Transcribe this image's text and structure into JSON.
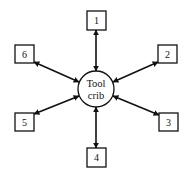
{
  "diagram": {
    "type": "hub-and-spoke",
    "hub": {
      "label_line1": "Tool",
      "label_line2": "crib",
      "cx": 96,
      "cy": 89,
      "r": 18
    },
    "colors": {
      "stroke": "#111111",
      "fill": "#ffffff"
    },
    "nodes": [
      {
        "id": "1",
        "label": "1",
        "x": 87,
        "y": 11,
        "w": 19,
        "h": 19
      },
      {
        "id": "2",
        "label": "2",
        "x": 158,
        "y": 45,
        "w": 19,
        "h": 18
      },
      {
        "id": "3",
        "label": "3",
        "x": 159,
        "y": 113,
        "w": 19,
        "h": 18
      },
      {
        "id": "4",
        "label": "4",
        "x": 87,
        "y": 148,
        "w": 19,
        "h": 19
      },
      {
        "id": "5",
        "label": "5",
        "x": 15,
        "y": 113,
        "w": 19,
        "h": 18
      },
      {
        "id": "6",
        "label": "6",
        "x": 15,
        "y": 45,
        "w": 19,
        "h": 18
      }
    ],
    "edges": [
      {
        "from": "hub",
        "to": "1",
        "bidirectional": true
      },
      {
        "from": "hub",
        "to": "2",
        "bidirectional": true
      },
      {
        "from": "hub",
        "to": "3",
        "bidirectional": true
      },
      {
        "from": "hub",
        "to": "4",
        "bidirectional": true
      },
      {
        "from": "hub",
        "to": "5",
        "bidirectional": true
      },
      {
        "from": "hub",
        "to": "6",
        "bidirectional": true
      }
    ]
  }
}
